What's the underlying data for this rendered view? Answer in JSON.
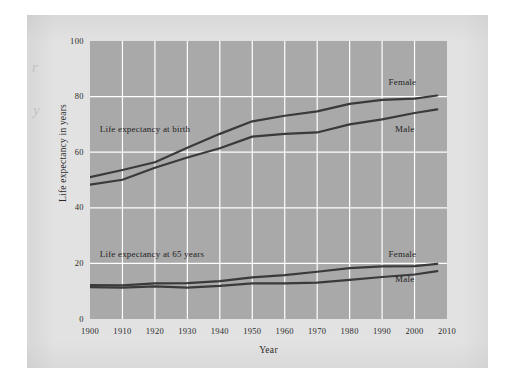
{
  "figure": {
    "background_color": "#e2e2e2",
    "plot_background_color": "#a9a9a9",
    "gridline_color": "#ffffff",
    "line_color": "#3a3a3a",
    "edge_marks": [
      "r",
      "y"
    ]
  },
  "chart_data": {
    "type": "line",
    "title": "",
    "xlabel": "Year",
    "ylabel": "Life expectancy in years",
    "xlim": [
      1900,
      2010
    ],
    "ylim": [
      0,
      100
    ],
    "xticks": [
      1900,
      1910,
      1920,
      1930,
      1940,
      1950,
      1960,
      1970,
      1980,
      1990,
      2000,
      2010
    ],
    "yticks": [
      0,
      20,
      40,
      60,
      80,
      100
    ],
    "grid": true,
    "legend_position": "inline-annotations",
    "annotations": [
      {
        "text": "Life expectancy at birth",
        "x": 1903,
        "y": 68
      },
      {
        "text": "Life expectancy at 65 years",
        "x": 1903,
        "y": 23
      },
      {
        "text": "Female",
        "x": 1992,
        "y": 85
      },
      {
        "text": "Male",
        "x": 1994,
        "y": 68
      },
      {
        "text": "Female",
        "x": 1992,
        "y": 23
      },
      {
        "text": "Male",
        "x": 1994,
        "y": 14
      }
    ],
    "x": [
      1900,
      1910,
      1920,
      1930,
      1940,
      1950,
      1960,
      1970,
      1980,
      1990,
      2000,
      2007
    ],
    "series": [
      {
        "name": "Life expectancy at birth — Female",
        "group": "Life expectancy at birth",
        "sex": "Female",
        "values": [
          51.0,
          53.6,
          56.4,
          61.6,
          66.6,
          71.1,
          73.1,
          74.7,
          77.4,
          78.8,
          79.3,
          80.4
        ]
      },
      {
        "name": "Life expectancy at birth — Male",
        "group": "Life expectancy at birth",
        "sex": "Male",
        "values": [
          48.3,
          50.1,
          54.4,
          58.1,
          61.4,
          65.6,
          66.6,
          67.1,
          70.0,
          71.8,
          74.1,
          75.4
        ]
      },
      {
        "name": "Life expectancy at 65 years — Female",
        "group": "Life expectancy at 65 years",
        "sex": "Female",
        "values": [
          12.2,
          12.1,
          12.8,
          12.9,
          13.6,
          15.0,
          15.8,
          17.0,
          18.3,
          18.9,
          19.0,
          19.8
        ]
      },
      {
        "name": "Life expectancy at 65 years — Male",
        "group": "Life expectancy at 65 years",
        "sex": "Male",
        "values": [
          11.5,
          11.3,
          11.7,
          11.3,
          11.9,
          12.8,
          12.8,
          13.1,
          14.1,
          15.1,
          16.0,
          17.2
        ]
      }
    ]
  },
  "axis": {
    "y_title": "Life expectancy in years",
    "x_title": "Year",
    "y_labels": [
      "100",
      "80",
      "60",
      "40",
      "20",
      "0"
    ],
    "x_labels": [
      "1900",
      "1910",
      "1920",
      "1930",
      "1940",
      "1950",
      "1960",
      "1970",
      "1980",
      "1990",
      "2000",
      "2010"
    ]
  },
  "labels": {
    "birth_group": "Life expectancy at birth",
    "age65_group": "Life expectancy at 65 years",
    "birth_female": "Female",
    "birth_male": "Male",
    "age65_female": "Female",
    "age65_male": "Male"
  }
}
